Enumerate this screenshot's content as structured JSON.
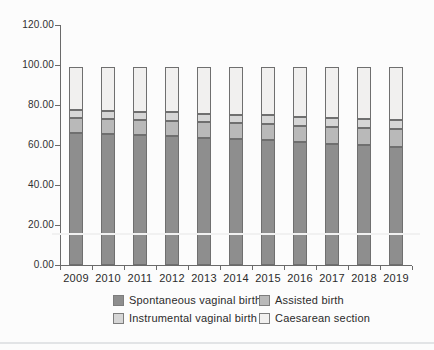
{
  "chart_data": {
    "type": "bar",
    "stacked": true,
    "title": "",
    "xlabel": "",
    "ylabel": "",
    "categories": [
      "2009",
      "2010",
      "2011",
      "2012",
      "2013",
      "2014",
      "2015",
      "2016",
      "2017",
      "2018",
      "2019"
    ],
    "series": [
      {
        "name": "Spontaneous vaginal birth",
        "color": "#8e8e8e",
        "values": [
          66.0,
          65.6,
          65.1,
          64.6,
          63.6,
          63.2,
          62.6,
          61.3,
          60.5,
          59.8,
          59.2
        ]
      },
      {
        "name": "Assisted birth",
        "color": "#b9b9b9",
        "values": [
          7.4,
          7.4,
          7.5,
          7.6,
          7.8,
          7.8,
          8.0,
          8.3,
          8.5,
          8.7,
          8.8
        ]
      },
      {
        "name": "Instrumental vaginal birth",
        "color": "#d6d6d6",
        "values": [
          4.0,
          4.0,
          4.0,
          4.1,
          4.2,
          4.2,
          4.3,
          4.4,
          4.5,
          4.6,
          4.7
        ]
      },
      {
        "name": "Caesarean section",
        "color": "#f1f0ef",
        "values": [
          21.6,
          22.0,
          22.4,
          22.7,
          23.4,
          23.8,
          24.1,
          25.0,
          25.5,
          25.9,
          26.3
        ]
      }
    ],
    "bar_totals": [
      99.0,
      99.0,
      99.0,
      99.0,
      99.0,
      99.0,
      99.0,
      99.0,
      99.0,
      99.0,
      99.0
    ],
    "ylim": [
      0,
      120
    ],
    "ytick_labels": [
      "0.00",
      "20.00",
      "40.00",
      "60.00",
      "80.00",
      "100.00",
      "120.00"
    ],
    "ytick_values": [
      0,
      20,
      40,
      60,
      80,
      100,
      120
    ],
    "grid": false,
    "legend_position": "bottom"
  },
  "legend": {
    "columns": 2,
    "rows": 2
  },
  "colors": {
    "axis": "#6a6a6a",
    "tick_label": "#303030",
    "segment_border": "#6f6f6f",
    "page_background": "#fcfcfc",
    "bottom_rule": "#e2e4e6"
  }
}
